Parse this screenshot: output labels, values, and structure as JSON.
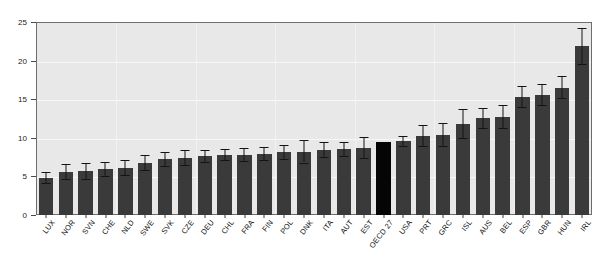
{
  "chart_data": {
    "type": "bar",
    "title": "",
    "subtitle": "",
    "xlabel": "",
    "ylabel": "",
    "ylim": [
      0,
      25
    ],
    "yticks": [
      0,
      5,
      10,
      15,
      20,
      25
    ],
    "grid": true,
    "legend": "none",
    "highlight_category": "OECD 27",
    "colors": {
      "bar": "#3a3a3a",
      "highlight_bar": "#050505",
      "plot_background": "#e8e8e8",
      "gridline": "#f7f7f7",
      "axis": "#6e6e6e",
      "error_bar": "#141414",
      "text": "#111111",
      "page_background": "#ffffff"
    },
    "categories": [
      "LUX",
      "NOR",
      "SVN",
      "CHE",
      "NLD",
      "SWE",
      "SVK",
      "CZE",
      "DEU",
      "CHL",
      "FRA",
      "FIN",
      "POL",
      "DNK",
      "ITA",
      "AUT",
      "EST",
      "OECD 27",
      "USA",
      "PRT",
      "GRC",
      "ISL",
      "AUS",
      "BEL",
      "ESP",
      "GBR",
      "HUN",
      "IRL"
    ],
    "values": [
      4.8,
      5.6,
      5.7,
      5.9,
      6.1,
      6.8,
      7.2,
      7.4,
      7.6,
      7.8,
      7.8,
      7.9,
      8.1,
      8.2,
      8.4,
      8.5,
      8.7,
      9.4,
      9.6,
      10.2,
      10.4,
      11.8,
      12.6,
      12.7,
      15.3,
      15.6,
      16.5,
      21.9
    ],
    "error_low": [
      4.1,
      4.6,
      4.7,
      5.0,
      5.2,
      5.8,
      6.3,
      6.5,
      6.9,
      7.1,
      7.0,
      7.1,
      7.3,
      6.8,
      7.5,
      7.6,
      7.4,
      null,
      9.0,
      8.9,
      9.0,
      10.0,
      11.3,
      11.3,
      14.0,
      14.3,
      15.1,
      19.6
    ],
    "error_high": [
      5.6,
      6.6,
      6.7,
      6.9,
      7.1,
      7.8,
      8.2,
      8.4,
      8.4,
      8.5,
      8.7,
      8.8,
      9.1,
      9.7,
      9.4,
      9.5,
      10.1,
      null,
      10.2,
      11.6,
      11.9,
      13.7,
      13.9,
      14.2,
      16.7,
      17.0,
      18.0,
      24.2
    ]
  }
}
